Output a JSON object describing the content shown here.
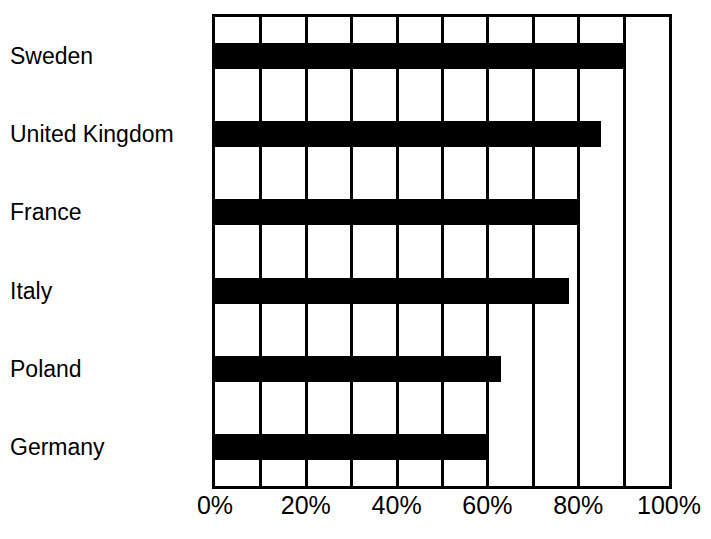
{
  "chart_data": {
    "type": "bar",
    "orientation": "horizontal",
    "title": "",
    "subtitle": "",
    "xlabel": "",
    "ylabel": "",
    "categories": [
      "Sweden",
      "United Kingdom",
      "France",
      "Italy",
      "Poland",
      "Germany"
    ],
    "values": [
      90,
      85,
      80,
      78,
      63,
      60
    ],
    "value_labels": [
      "90%",
      "85%",
      "80%",
      "78%",
      "63%",
      "60%"
    ],
    "xlim": [
      0,
      100
    ],
    "x_tick_values": [
      0,
      20,
      40,
      60,
      80,
      100
    ],
    "x_tick_labels": [
      "0%",
      "20%",
      "40%",
      "60%",
      "80%",
      "100%"
    ],
    "gridline_values": [
      10,
      20,
      30,
      40,
      50,
      60,
      70,
      80,
      90
    ],
    "grid": true,
    "legend": "none",
    "bar_color": "#000000",
    "plot_background": "#ffffff",
    "axis_color": "#000000"
  }
}
